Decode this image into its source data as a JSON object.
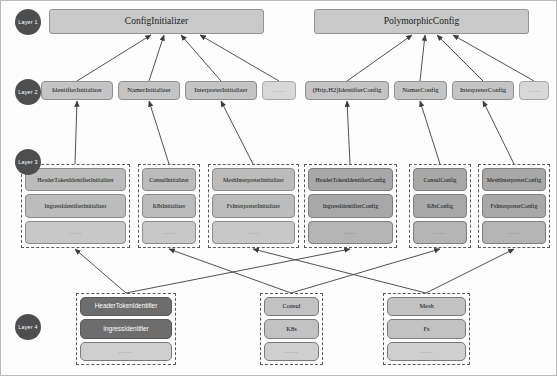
{
  "diagram": {
    "colors": {
      "header_fill": "#c9c9c9",
      "node_fill": "#bcbcbc",
      "dark_fill": "#6d6d6d",
      "badge_fill": "#4e4e4e",
      "edge": "#3c3c3c",
      "group_border": "#5a5a5a"
    }
  },
  "badges": [
    {
      "label": "Layer 1",
      "x": 14,
      "y": 8
    },
    {
      "label": "Layer 2",
      "x": 14,
      "y": 78
    },
    {
      "label": "Layer 3",
      "x": 14,
      "y": 148
    },
    {
      "label": "Layer 4",
      "x": 14,
      "y": 313
    }
  ],
  "layer1": {
    "nodes": [
      {
        "label": "ConfigInitializer",
        "x": 48,
        "y": 8,
        "w": 215,
        "h": 25
      },
      {
        "label": "PolymorphicConfig",
        "x": 313,
        "y": 8,
        "w": 215,
        "h": 25
      }
    ]
  },
  "layer2": {
    "nodes": [
      {
        "label": "IdentifierInitializer",
        "x": 40,
        "y": 80,
        "w": 72,
        "h": 19,
        "faded": false
      },
      {
        "label": "NamerInitializer",
        "x": 117,
        "y": 80,
        "w": 62,
        "h": 19,
        "faded": false
      },
      {
        "label": "InterpreterInitializer",
        "x": 184,
        "y": 80,
        "w": 72,
        "h": 19,
        "faded": false
      },
      {
        "label": "......",
        "x": 261,
        "y": 80,
        "w": 34,
        "h": 19,
        "faded": true
      },
      {
        "label": "(Http,H2)IdentifierConfig",
        "x": 304,
        "y": 80,
        "w": 84,
        "h": 19,
        "faded": false
      },
      {
        "label": "NamerConfig",
        "x": 393,
        "y": 80,
        "w": 53,
        "h": 19,
        "faded": false
      },
      {
        "label": "InterpreterConfig",
        "x": 451,
        "y": 80,
        "w": 62,
        "h": 19,
        "faded": false
      },
      {
        "label": "......",
        "x": 518,
        "y": 80,
        "w": 30,
        "h": 19,
        "faded": true
      }
    ]
  },
  "layer3": {
    "groups": [
      {
        "x": 20,
        "y": 163,
        "w": 109,
        "h": 84,
        "dark": false,
        "items": [
          "HeaderTokenIdentifierInitializer",
          "IngressIdentifierInitializer",
          "......"
        ]
      },
      {
        "x": 137,
        "y": 163,
        "w": 62,
        "h": 84,
        "dark": false,
        "items": [
          "ConsulInitializer",
          "K8sInitializer",
          "......"
        ]
      },
      {
        "x": 207,
        "y": 163,
        "w": 91,
        "h": 84,
        "dark": false,
        "items": [
          "MeshInterpreterInitializer",
          "FsInterpreterInitializer",
          "......"
        ]
      },
      {
        "x": 303,
        "y": 163,
        "w": 93,
        "h": 84,
        "dark": true,
        "items": [
          "HeaderTokenIdentifierConfig",
          "IngressIdentifierConfig",
          "......"
        ]
      },
      {
        "x": 408,
        "y": 163,
        "w": 62,
        "h": 84,
        "dark": true,
        "items": [
          "ConsulConfig",
          "K8sConfig",
          "......"
        ]
      },
      {
        "x": 477,
        "y": 163,
        "w": 72,
        "h": 84,
        "dark": true,
        "items": [
          "MeshInterpreterConfig",
          "FsInterpreterConfig",
          "......"
        ]
      }
    ]
  },
  "layer4": {
    "groups": [
      {
        "x": 75,
        "y": 292,
        "w": 100,
        "h": 72,
        "strong": true,
        "items": [
          "HeaderTokenIdentifier",
          "IngressIdentifier",
          "......"
        ]
      },
      {
        "x": 259,
        "y": 292,
        "w": 63,
        "h": 72,
        "strong": false,
        "items": [
          "Consul",
          "K8s",
          "......"
        ]
      },
      {
        "x": 382,
        "y": 292,
        "w": 87,
        "h": 72,
        "strong": false,
        "items": [
          "Mesh",
          "Fs",
          "......"
        ]
      }
    ]
  },
  "edges": {
    "layer2_to_layer1": [
      {
        "from": [
          76,
          80
        ],
        "to": [
          150,
          34
        ]
      },
      {
        "from": [
          148,
          80
        ],
        "to": [
          163,
          34
        ]
      },
      {
        "from": [
          220,
          80
        ],
        "to": [
          180,
          34
        ]
      },
      {
        "from": [
          278,
          80
        ],
        "to": [
          199,
          34
        ]
      },
      {
        "from": [
          346,
          80
        ],
        "to": [
          411,
          34
        ]
      },
      {
        "from": [
          419,
          80
        ],
        "to": [
          424,
          34
        ]
      },
      {
        "from": [
          482,
          80
        ],
        "to": [
          436,
          34
        ]
      },
      {
        "from": [
          533,
          80
        ],
        "to": [
          452,
          34
        ]
      }
    ],
    "layer3_to_layer2": [
      {
        "from": [
          74,
          163
        ],
        "to": [
          76,
          100
        ]
      },
      {
        "from": [
          168,
          163
        ],
        "to": [
          148,
          100
        ]
      },
      {
        "from": [
          252,
          163
        ],
        "to": [
          220,
          100
        ]
      },
      {
        "from": [
          349,
          163
        ],
        "to": [
          346,
          100
        ]
      },
      {
        "from": [
          439,
          163
        ],
        "to": [
          419,
          100
        ]
      },
      {
        "from": [
          513,
          163
        ],
        "to": [
          482,
          100
        ]
      }
    ],
    "layer4_to_layer3": [
      {
        "from": [
          125,
          292
        ],
        "to": [
          74,
          248
        ]
      },
      {
        "from": [
          125,
          292
        ],
        "to": [
          349,
          248
        ]
      },
      {
        "from": [
          290,
          292
        ],
        "to": [
          168,
          248
        ]
      },
      {
        "from": [
          290,
          292
        ],
        "to": [
          439,
          248
        ]
      },
      {
        "from": [
          425,
          292
        ],
        "to": [
          252,
          248
        ]
      },
      {
        "from": [
          425,
          292
        ],
        "to": [
          513,
          248
        ]
      }
    ]
  }
}
